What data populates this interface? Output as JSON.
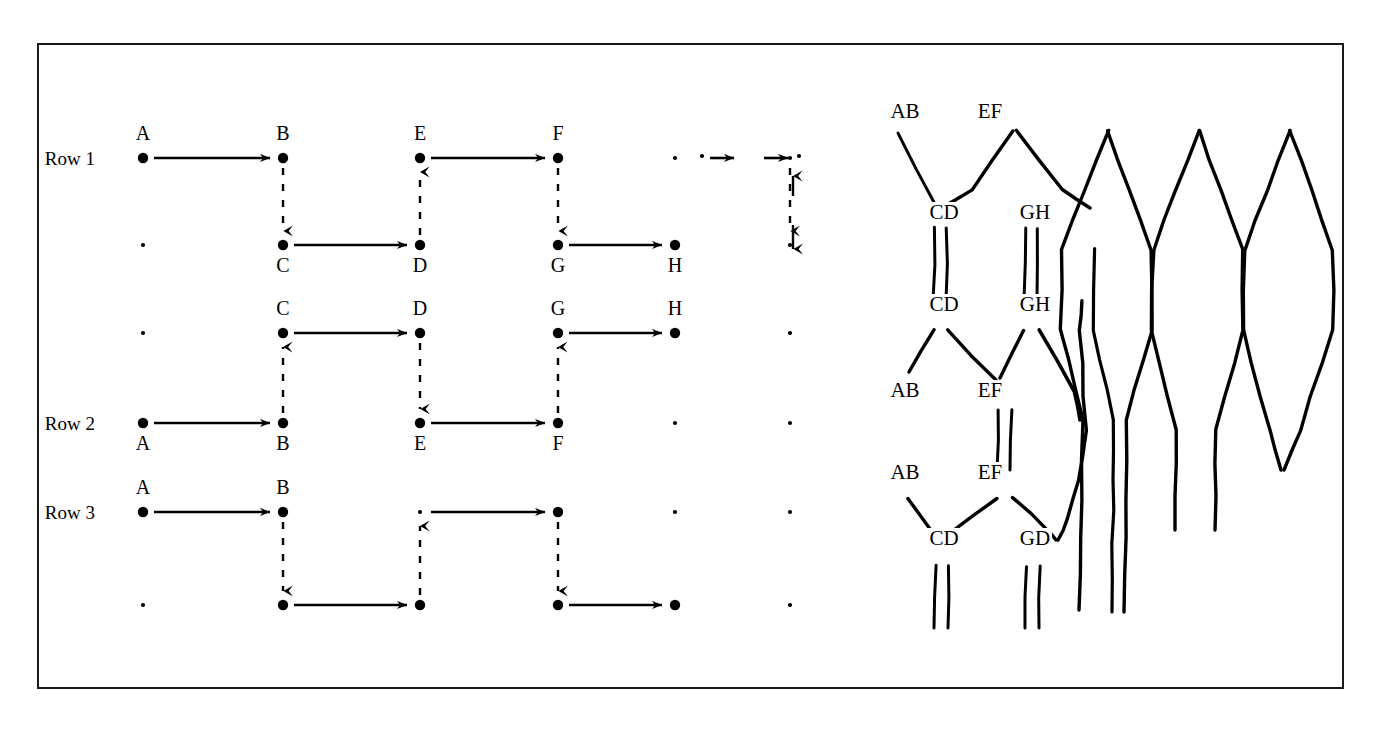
{
  "figure": {
    "border_color": "#1a1a1a",
    "ink_color": "#000000",
    "background": "#ffffff"
  },
  "left_diagram": {
    "name": "row-permutation-grid",
    "row_labels": [
      "Row 1",
      "Row 2",
      "Row 3"
    ],
    "columns_x": [
      143,
      283,
      420,
      558,
      675,
      790
    ],
    "solid_arrow_style": "solid horizontal arrow",
    "dashed_arrow_style": "dashed vertical arrow",
    "rows": [
      {
        "label": "Row 1",
        "upper_nodes": [
          {
            "letter": "A",
            "col": 0,
            "label_pos": "above"
          },
          {
            "letter": "B",
            "col": 1,
            "label_pos": "above"
          },
          {
            "letter": "E",
            "col": 2,
            "label_pos": "above"
          },
          {
            "letter": "F",
            "col": 3,
            "label_pos": "above"
          },
          {
            "letter": "",
            "col": 4,
            "label_pos": "none"
          },
          {
            "letter": "",
            "col": 5,
            "label_pos": "none"
          }
        ],
        "lower_nodes": [
          {
            "letter": "",
            "col": 0,
            "label_pos": "none"
          },
          {
            "letter": "C",
            "col": 1,
            "label_pos": "below"
          },
          {
            "letter": "D",
            "col": 2,
            "label_pos": "below"
          },
          {
            "letter": "G",
            "col": 3,
            "label_pos": "below"
          },
          {
            "letter": "H",
            "col": 4,
            "label_pos": "below"
          },
          {
            "letter": "",
            "col": 5,
            "label_pos": "none"
          }
        ]
      },
      {
        "label": "Row 2",
        "upper_nodes": [
          {
            "letter": "",
            "col": 0,
            "label_pos": "none"
          },
          {
            "letter": "C",
            "col": 1,
            "label_pos": "above"
          },
          {
            "letter": "D",
            "col": 2,
            "label_pos": "above"
          },
          {
            "letter": "G",
            "col": 3,
            "label_pos": "above"
          },
          {
            "letter": "H",
            "col": 4,
            "label_pos": "above"
          },
          {
            "letter": "",
            "col": 5,
            "label_pos": "none"
          }
        ],
        "lower_nodes": [
          {
            "letter": "A",
            "col": 0,
            "label_pos": "below"
          },
          {
            "letter": "B",
            "col": 1,
            "label_pos": "below"
          },
          {
            "letter": "E",
            "col": 2,
            "label_pos": "below"
          },
          {
            "letter": "F",
            "col": 3,
            "label_pos": "below"
          },
          {
            "letter": "",
            "col": 4,
            "label_pos": "none"
          },
          {
            "letter": "",
            "col": 5,
            "label_pos": "none"
          }
        ]
      },
      {
        "label": "Row 3",
        "upper_nodes": [
          {
            "letter": "A",
            "col": 0,
            "label_pos": "above"
          },
          {
            "letter": "B",
            "col": 1,
            "label_pos": "above"
          },
          {
            "letter": "",
            "col": 2,
            "label_pos": "none"
          },
          {
            "letter": "",
            "col": 3,
            "label_pos": "none"
          },
          {
            "letter": "",
            "col": 4,
            "label_pos": "none"
          },
          {
            "letter": "",
            "col": 5,
            "label_pos": "none"
          }
        ],
        "lower_nodes": [
          {
            "letter": "",
            "col": 0,
            "label_pos": "none"
          },
          {
            "letter": "",
            "col": 1,
            "label_pos": "none"
          },
          {
            "letter": "",
            "col": 2,
            "label_pos": "none"
          },
          {
            "letter": "",
            "col": 3,
            "label_pos": "none"
          },
          {
            "letter": "",
            "col": 4,
            "label_pos": "none"
          },
          {
            "letter": "",
            "col": 5,
            "label_pos": "none"
          }
        ]
      }
    ]
  },
  "right_diagram": {
    "name": "braid-lattice",
    "node_labels": [
      {
        "text": "AB",
        "x": 905,
        "y": 118
      },
      {
        "text": "EF",
        "x": 990,
        "y": 118
      },
      {
        "text": "CD",
        "x": 944,
        "y": 219
      },
      {
        "text": "GH",
        "x": 1035,
        "y": 219
      },
      {
        "text": "CD",
        "x": 944,
        "y": 311
      },
      {
        "text": "GH",
        "x": 1035,
        "y": 311
      },
      {
        "text": "AB",
        "x": 905,
        "y": 397
      },
      {
        "text": "EF",
        "x": 990,
        "y": 397
      },
      {
        "text": "AB",
        "x": 905,
        "y": 479
      },
      {
        "text": "EF",
        "x": 990,
        "y": 479
      },
      {
        "text": "CD",
        "x": 944,
        "y": 545
      },
      {
        "text": "GD",
        "x": 1035,
        "y": 545
      }
    ],
    "strand_count": 8,
    "description": "interleaved zigzag strands forming elongated hexagonal cells"
  }
}
